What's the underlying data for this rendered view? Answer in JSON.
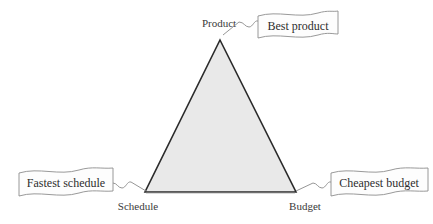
{
  "diagram": {
    "colors": {
      "triangle_fill": "#e9e9e9",
      "triangle_stroke": "#2b2b2b",
      "banner_fill": "#fdfdfd",
      "banner_stroke": "#8d8d8d",
      "connector_stroke": "#8a8a8a",
      "text": "#2e2e2e",
      "background": "#ffffff"
    },
    "triangle": {
      "apex": {
        "x": 220,
        "y": 40
      },
      "bottom_left": {
        "x": 145,
        "y": 192
      },
      "bottom_right": {
        "x": 296,
        "y": 192
      }
    },
    "vertices": [
      {
        "id": "product",
        "label": "Product",
        "x": 219,
        "y": 27,
        "anchor": "middle"
      },
      {
        "id": "schedule",
        "label": "Schedule",
        "x": 138,
        "y": 210,
        "anchor": "middle"
      },
      {
        "id": "budget",
        "label": "Budget",
        "x": 305,
        "y": 210,
        "anchor": "middle"
      }
    ],
    "banners": [
      {
        "id": "best-product",
        "label": "Best product",
        "text_x": 298,
        "text_y": 33,
        "box": {
          "x": 258,
          "y": 11,
          "width": 80,
          "height": 29
        }
      },
      {
        "id": "fastest-schedule",
        "label": "Fastest schedule",
        "text_x": 66,
        "text_y": 187,
        "box": {
          "x": 19,
          "y": 168,
          "width": 94,
          "height": 30
        }
      },
      {
        "id": "cheapest-budget",
        "label": "Cheapest budget",
        "text_x": 378,
        "text_y": 187,
        "box": {
          "x": 331,
          "y": 168,
          "width": 97,
          "height": 30
        }
      }
    ],
    "connectors": [
      {
        "id": "product-to-best-product",
        "from": "product",
        "to": "best-product"
      },
      {
        "id": "schedule-to-fastest-schedule",
        "from": "schedule",
        "to": "fastest-schedule"
      },
      {
        "id": "budget-to-cheapest-budget",
        "from": "budget",
        "to": "cheapest-budget"
      }
    ]
  }
}
